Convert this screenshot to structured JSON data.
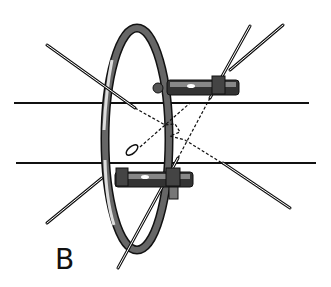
{
  "figure": {
    "panel_label": "B",
    "colors": {
      "ink": "#111111",
      "ring_fill": "#555555",
      "ring_highlight": "#dddddd",
      "background": "#ffffff"
    }
  }
}
